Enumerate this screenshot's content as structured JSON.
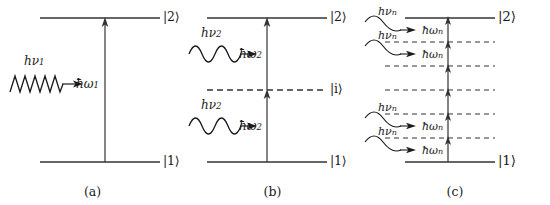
{
  "figure": {
    "width": 550,
    "height": 205,
    "background": "#ffffff",
    "line_color": "#333333",
    "text_color": "#1a1a1a"
  },
  "panels": [
    {
      "id": "a",
      "caption": "(a)",
      "process": "single-photon absorption",
      "levels": [
        {
          "name": "ground",
          "ket": "|1⟩",
          "style": "solid",
          "y": 162
        },
        {
          "name": "excited",
          "ket": "|2⟩",
          "style": "solid",
          "y": 18
        }
      ],
      "transitions": [
        {
          "energy_label": "ħω",
          "energy_sub": "1",
          "from_y": 162,
          "to_y": 18
        }
      ],
      "photons": [
        {
          "label": "hν",
          "sub": "1",
          "wave_style": "zigzag",
          "cycles": 6,
          "y": 84
        }
      ]
    },
    {
      "id": "b",
      "caption": "(b)",
      "process": "two-photon absorption via virtual level",
      "levels": [
        {
          "name": "ground",
          "ket": "|1⟩",
          "style": "solid",
          "y": 162
        },
        {
          "name": "intermediate",
          "ket": "|i⟩",
          "style": "dashed",
          "y": 90
        },
        {
          "name": "excited",
          "ket": "|2⟩",
          "style": "solid",
          "y": 18
        }
      ],
      "transitions": [
        {
          "energy_label": "ħω",
          "energy_sub": "2",
          "from_y": 162,
          "to_y": 90
        },
        {
          "energy_label": "ħω",
          "energy_sub": "2",
          "from_y": 90,
          "to_y": 18
        }
      ],
      "photons": [
        {
          "label": "hν",
          "sub": "2",
          "wave_style": "sine",
          "cycles": 4,
          "y": 54
        },
        {
          "label": "hν",
          "sub": "2",
          "wave_style": "sine",
          "cycles": 4,
          "y": 126
        }
      ]
    },
    {
      "id": "c",
      "caption": "(c)",
      "process": "n-photon absorption via multiple virtual levels",
      "levels": [
        {
          "name": "ground",
          "ket": "|1⟩",
          "style": "solid",
          "y": 162
        },
        {
          "name": "virtual-1",
          "ket": "",
          "style": "dashed",
          "y": 138
        },
        {
          "name": "virtual-2",
          "ket": "",
          "style": "dashed",
          "y": 114
        },
        {
          "name": "virtual-3",
          "ket": "",
          "style": "dashed",
          "y": 90
        },
        {
          "name": "virtual-4",
          "ket": "",
          "style": "dashed",
          "y": 66
        },
        {
          "name": "virtual-5",
          "ket": "",
          "style": "dashed",
          "y": 42
        },
        {
          "name": "excited",
          "ket": "|2⟩",
          "style": "solid",
          "y": 18
        }
      ],
      "transitions": [
        {
          "energy_label": "ħω",
          "energy_sub": "n",
          "from_y": 162,
          "to_y": 138
        },
        {
          "energy_label": "ħω",
          "energy_sub": "n",
          "from_y": 138,
          "to_y": 114
        },
        {
          "energy_label": "",
          "energy_sub": "",
          "from_y": 114,
          "to_y": 90
        },
        {
          "energy_label": "",
          "energy_sub": "",
          "from_y": 90,
          "to_y": 66
        },
        {
          "energy_label": "ħω",
          "energy_sub": "n",
          "from_y": 66,
          "to_y": 42
        },
        {
          "energy_label": "ħω",
          "energy_sub": "n",
          "from_y": 42,
          "to_y": 18
        }
      ],
      "photons": [
        {
          "label": "hν",
          "sub": "n",
          "wave_style": "curve",
          "y": 22
        },
        {
          "label": "hν",
          "sub": "n",
          "wave_style": "curve",
          "y": 46
        },
        {
          "label": "hν",
          "sub": "n",
          "wave_style": "curve",
          "y": 118
        },
        {
          "label": "hν",
          "sub": "n",
          "wave_style": "curve",
          "y": 142
        }
      ]
    }
  ],
  "labels": {
    "ket_ground": "|1⟩",
    "ket_excited": "|2⟩",
    "ket_intermediate": "|i⟩",
    "photon_a": "hν",
    "photon_a_sub": "1",
    "photon_b": "hν",
    "photon_b_sub": "2",
    "photon_c": "hν",
    "photon_c_sub": "n",
    "energy_a": "ħω",
    "energy_a_sub": "1",
    "energy_b": "ħω",
    "energy_b_sub": "2",
    "energy_c": "ħω",
    "energy_c_sub": "n",
    "caption_a": "(a)",
    "caption_b": "(b)",
    "caption_c": "(c)"
  }
}
